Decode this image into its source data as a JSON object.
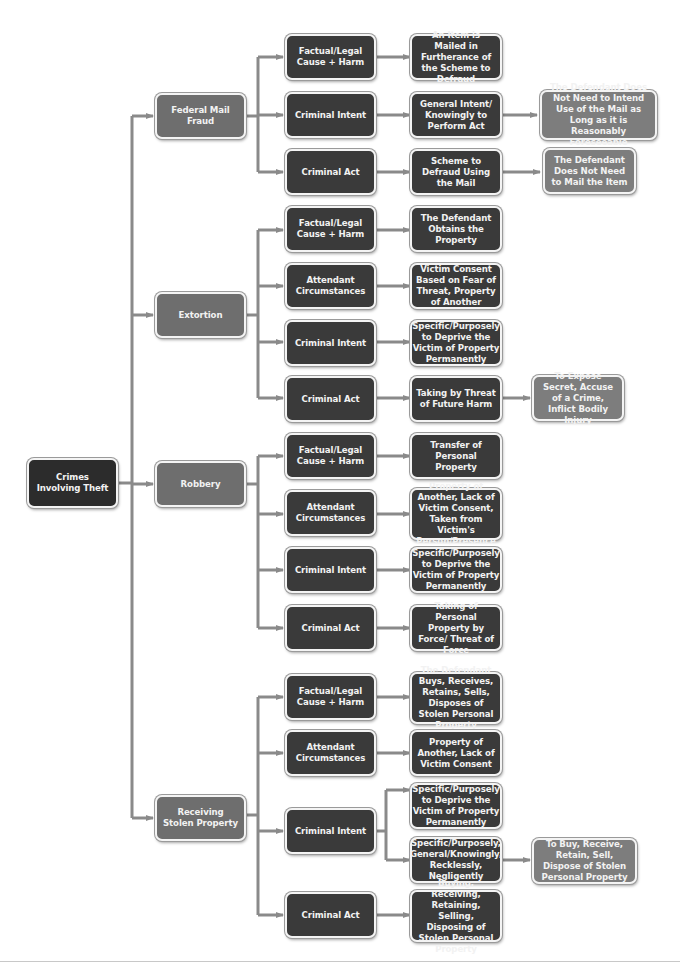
{
  "diagram": {
    "root": {
      "label": "Crimes Involving Theft"
    },
    "colors": {
      "root": "#2c2c2c",
      "category": "#6e6e6e",
      "element": "#3a3a3a",
      "detail": "#3a3a3a",
      "note": "#7d7d7d",
      "connector": "#8a8a8a"
    },
    "categories": [
      {
        "label": "Federal Mail Fraud",
        "elements": [
          {
            "label": "Factual/Legal Cause + Harm",
            "details": [
              {
                "label": "An Item is Mailed in Furtherance of the Scheme to Defraud"
              }
            ]
          },
          {
            "label": "Criminal Intent",
            "details": [
              {
                "label": "General Intent/ Knowingly to Perform Act",
                "note": "The Defendant Does Not Need to Intend Use of the Mail as Long as it is Reasonably Foreseeable"
              }
            ]
          },
          {
            "label": "Criminal Act",
            "details": [
              {
                "label": "Scheme to Defraud Using the Mail",
                "note": "The Defendant Does Not Need to Mail the Item"
              }
            ]
          }
        ]
      },
      {
        "label": "Extortion",
        "elements": [
          {
            "label": "Factual/Legal Cause + Harm",
            "details": [
              {
                "label": "The Defendant Obtains the Property"
              }
            ]
          },
          {
            "label": "Attendant Circumstances",
            "details": [
              {
                "label": "Victim Consent Based on Fear of Threat, Property of Another"
              }
            ]
          },
          {
            "label": "Criminal Intent",
            "details": [
              {
                "label": "Specific/Purposely to Deprive the Victim of Property Permanently"
              }
            ]
          },
          {
            "label": "Criminal Act",
            "details": [
              {
                "label": "Taking by Threat of Future Harm",
                "note": "To Expose Secret, Accuse of a Crime, Inflict Bodily Injury"
              }
            ]
          }
        ]
      },
      {
        "label": "Robbery",
        "elements": [
          {
            "label": "Factual/Legal Cause + Harm",
            "details": [
              {
                "label": "Transfer of Personal Property"
              }
            ]
          },
          {
            "label": "Attendant Circumstances",
            "details": [
              {
                "label": "Property of Another, Lack of Victim Consent, Taken from Victim's Person/Presence"
              }
            ]
          },
          {
            "label": "Criminal Intent",
            "details": [
              {
                "label": "Specific/Purposely to Deprive the Victim of Property Permanently"
              }
            ]
          },
          {
            "label": "Criminal Act",
            "details": [
              {
                "label": "Taking of Personal Property by Force/ Threat of Force"
              }
            ]
          }
        ]
      },
      {
        "label": "Receiving Stolen Property",
        "elements": [
          {
            "label": "Factual/Legal Cause + Harm",
            "details": [
              {
                "label": "The Defendant Buys, Receives, Retains, Sells, Disposes of Stolen Personal Property"
              }
            ]
          },
          {
            "label": "Attendant Circumstances",
            "details": [
              {
                "label": "Property of Another, Lack of Victim Consent"
              }
            ]
          },
          {
            "label": "Criminal Intent",
            "details": [
              {
                "label": "Specific/Purposely to Deprive the Victim of Property Permanently"
              },
              {
                "label": "Specific/Purposely, General/Knowingly, Recklessly, Negligently",
                "note": "To Buy, Receive, Retain, Sell, Dispose of Stolen Personal Property"
              }
            ]
          },
          {
            "label": "Criminal Act",
            "details": [
              {
                "label": "Buying, Receiving, Retaining, Selling, Disposing of Stolen Personal Property"
              }
            ]
          }
        ]
      }
    ]
  }
}
